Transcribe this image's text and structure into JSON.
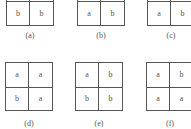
{
  "panels": [
    {
      "id": "a",
      "label": "(a)",
      "cells": [
        [
          "",
          ""
        ],
        [
          "b",
          "b"
        ]
      ]
    },
    {
      "id": "b",
      "label": "(b)",
      "cells": [
        [
          "",
          ""
        ],
        [
          "a",
          "b"
        ]
      ]
    },
    {
      "id": "c",
      "label": "(c)",
      "cells": [
        [
          "",
          ""
        ],
        [
          "a",
          "b"
        ]
      ]
    },
    {
      "id": "d",
      "label": "(d)",
      "cells": [
        [
          "a",
          "a"
        ],
        [
          "b",
          "a"
        ]
      ]
    },
    {
      "id": "e",
      "label": "(e)",
      "cells": [
        [
          "a",
          "b"
        ],
        [
          "b",
          "b"
        ]
      ]
    },
    {
      "id": "f",
      "label": "(f)",
      "cells": [
        [
          "a",
          "b"
        ],
        [
          "a",
          "a"
        ]
      ]
    }
  ]
}
